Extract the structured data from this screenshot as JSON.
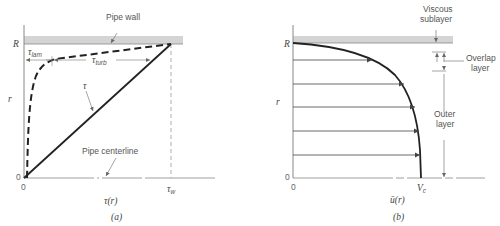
{
  "panel_a": {
    "caption": "(a)",
    "x_axis_label": "τ(r)",
    "y_axis_label": "r",
    "y_top_tick": "R",
    "origin_y": "0",
    "origin_x": "0",
    "x_end_tick": "τ",
    "x_end_tick_sub": "w",
    "wall_label": "Pipe wall",
    "centerline_label": "Pipe centerline",
    "tau_label": "τ",
    "tau_lam": "τ",
    "tau_lam_sub": "lam",
    "tau_turb": "τ",
    "tau_turb_sub": "turb"
  },
  "panel_b": {
    "caption": "(b)",
    "x_axis_label": "ū(r)",
    "y_axis_label": "r",
    "y_top_tick": "R",
    "origin_y": "0",
    "origin_x": "0",
    "x_end_tick": "V",
    "x_end_tick_sub": "c",
    "viscous_label_1": "Viscous",
    "viscous_label_2": "sublayer",
    "overlap_label_1": "Overlap",
    "overlap_label_2": "layer",
    "outer_label_1": "Outer",
    "outer_label_2": "layer"
  },
  "colors": {
    "wall_fill": "#d4d4d4",
    "line": "#222222",
    "axis": "#777777",
    "text": "#555555"
  }
}
